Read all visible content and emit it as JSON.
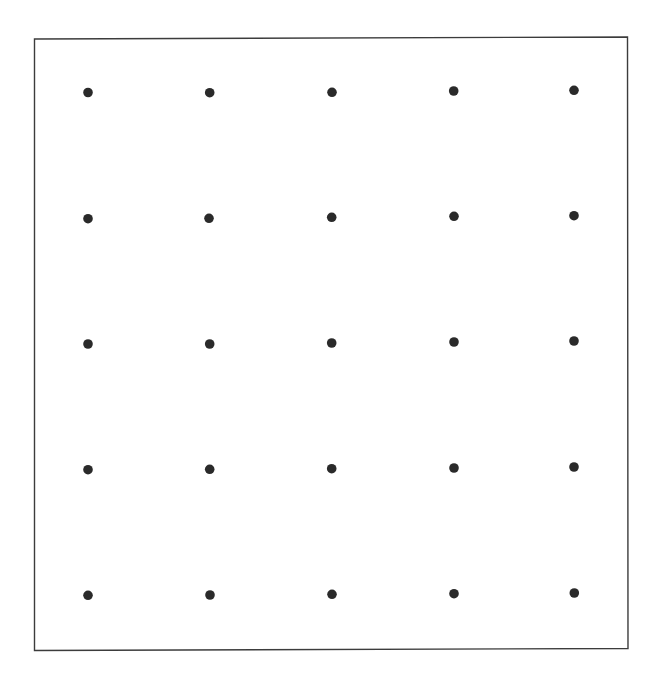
{
  "diagram": {
    "type": "dot-grid",
    "rows": 5,
    "columns": 5,
    "background_color": "#ffffff",
    "frame": {
      "corners": [
        [
          34.5,
          39
        ],
        [
          627.5,
          37
        ],
        [
          628,
          648.5
        ],
        [
          34.5,
          650.5
        ]
      ],
      "stroke_color": "#3c3c3c",
      "stroke_width": 1.4
    },
    "dot": {
      "radius": 4.8,
      "color": "#2a2a2a"
    },
    "dots": [
      [
        [
          88,
          92.5
        ],
        [
          209.7,
          92.7
        ],
        [
          332,
          92.3
        ],
        [
          453.7,
          91
        ],
        [
          574,
          90.3
        ]
      ],
      [
        [
          88,
          218.7
        ],
        [
          209,
          218.3
        ],
        [
          331.7,
          217.3
        ],
        [
          454,
          216.3
        ],
        [
          574,
          215.7
        ]
      ],
      [
        [
          88,
          344
        ],
        [
          209.7,
          344
        ],
        [
          331.7,
          343
        ],
        [
          454,
          342
        ],
        [
          574,
          341
        ]
      ],
      [
        [
          88,
          469.7
        ],
        [
          209.7,
          469.3
        ],
        [
          331.7,
          468.7
        ],
        [
          454,
          468
        ],
        [
          574,
          467
        ]
      ],
      [
        [
          88,
          595.3
        ],
        [
          210,
          595
        ],
        [
          332,
          594.3
        ],
        [
          454,
          593.7
        ],
        [
          574.3,
          593
        ]
      ]
    ]
  }
}
